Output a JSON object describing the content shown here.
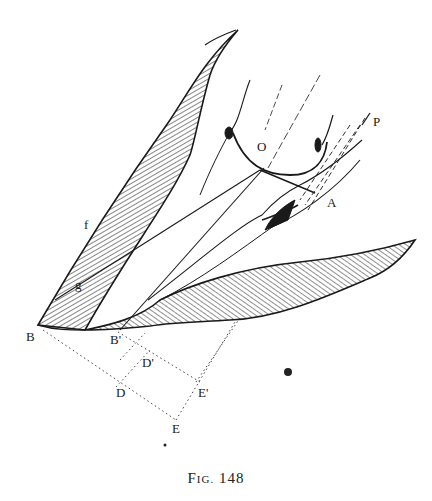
{
  "figure": {
    "caption": {
      "prefix_big": "F",
      "prefix_small": "IG.",
      "number": "148"
    },
    "labels": {
      "P": "P",
      "O": "O",
      "A": "A",
      "f": "f",
      "g": "g",
      "B": "B",
      "B_prime": "B'",
      "D_prime": "D'",
      "D": "D",
      "E_prime": "E'",
      "E": "E"
    },
    "colors": {
      "ink": "#1a1a1a",
      "hatch": "#333333",
      "paper": "#ffffff"
    }
  }
}
